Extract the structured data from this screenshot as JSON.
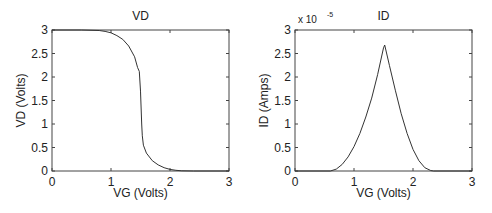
{
  "chart_data": [
    {
      "type": "line",
      "title": "VD",
      "xlabel": "VG (Volts)",
      "ylabel": "VD (Volts)",
      "xlim": [
        0,
        3
      ],
      "ylim": [
        0,
        3
      ],
      "xticks": [
        "0",
        "1",
        "2",
        "3"
      ],
      "yticks": [
        "0",
        "0.5",
        "1",
        "1.5",
        "2",
        "2.5",
        "3"
      ],
      "grid": false,
      "series": [
        {
          "name": "VD",
          "x": [
            0,
            0.5,
            0.8,
            0.9,
            1.0,
            1.1,
            1.2,
            1.3,
            1.4,
            1.45,
            1.48,
            1.5,
            1.52,
            1.53,
            1.55,
            1.6,
            1.7,
            1.8,
            1.9,
            2.0,
            2.1,
            2.2,
            2.4,
            3.0
          ],
          "y": [
            3,
            3,
            2.99,
            2.97,
            2.94,
            2.88,
            2.8,
            2.66,
            2.43,
            2.2,
            2.12,
            1.7,
            1.0,
            0.75,
            0.55,
            0.38,
            0.22,
            0.13,
            0.07,
            0.035,
            0.015,
            0.005,
            0,
            0
          ]
        }
      ]
    },
    {
      "type": "line",
      "title": "ID",
      "xlabel": "VG (Volts)",
      "ylabel": "ID (Amps)",
      "xlim": [
        0,
        3
      ],
      "ylim": [
        0,
        3e-05
      ],
      "y_multiplier": "x 10",
      "y_exponent": "-5",
      "xticks": [
        "0",
        "1",
        "2",
        "3"
      ],
      "yticks": [
        "0",
        "0.5",
        "1",
        "1.5",
        "2",
        "2.5",
        "3"
      ],
      "grid": false,
      "series": [
        {
          "name": "ID (x1e-5)",
          "x": [
            0,
            0.6,
            0.7,
            0.8,
            0.9,
            1.0,
            1.1,
            1.2,
            1.3,
            1.4,
            1.5,
            1.52,
            1.6,
            1.7,
            1.8,
            1.9,
            2.0,
            2.1,
            2.2,
            2.3,
            2.35,
            3.0
          ],
          "y": [
            0,
            0,
            0.04,
            0.14,
            0.3,
            0.52,
            0.8,
            1.15,
            1.55,
            2.05,
            2.62,
            2.68,
            2.25,
            1.72,
            1.22,
            0.8,
            0.46,
            0.22,
            0.07,
            0.01,
            0,
            0
          ]
        }
      ]
    }
  ]
}
